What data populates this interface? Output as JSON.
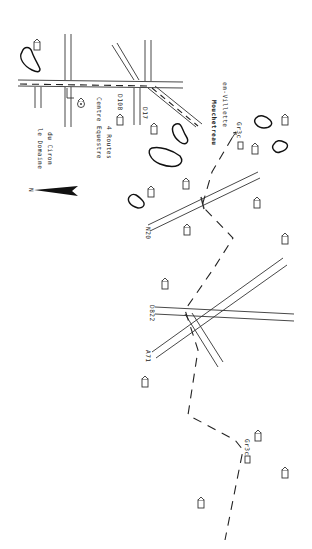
{
  "map": {
    "orientation": "rotated 90deg clockwise; north arrow points left",
    "north_arrow": {
      "label": "N",
      "icon": "north-arrow-icon"
    },
    "labels": {
      "domaine_line1": "le Domaine",
      "domaine_line2": "du Ciron",
      "centre_line1": "Centre Equestre",
      "centre_line2": "4 Routes",
      "d108": "D108",
      "d17": "D17",
      "mouchetreau": "Mouchetreau",
      "villette": "en-Villette",
      "gr3c_top": "Gr3c",
      "n20": "N20",
      "d822": "D822",
      "a71": "A71",
      "gr3c_bottom": "Gr3c"
    },
    "legend_icons": [
      "house-icon",
      "pond-icon",
      "road-icon",
      "trail-icon",
      "castle-icon"
    ],
    "colors": {
      "ink": "#222222",
      "paper": "#ffffff"
    }
  }
}
